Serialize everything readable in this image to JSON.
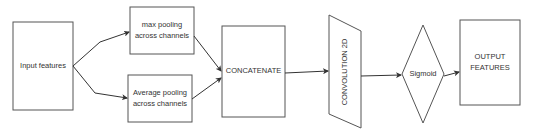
{
  "diagram": {
    "nodes": {
      "input": {
        "label": "Input features",
        "shape": "rectangle"
      },
      "max_pool": {
        "label": "max pooling across channels",
        "shape": "rectangle"
      },
      "avg_pool": {
        "label": "Average pooling across channels",
        "shape": "rectangle"
      },
      "concat": {
        "label": "CONCATENATE",
        "shape": "rectangle"
      },
      "conv": {
        "label": "CONVOLUTION 2D",
        "shape": "parallelogram"
      },
      "sigmoid": {
        "label": "Sigmoid",
        "shape": "diamond"
      },
      "output": {
        "label": "OUTPUT FEATURES",
        "shape": "rectangle"
      }
    },
    "edges": [
      {
        "from": "Input features",
        "to": "max pooling across channels"
      },
      {
        "from": "Input features",
        "to": "Average pooling across channels"
      },
      {
        "from": "max pooling across channels",
        "to": "CONCATENATE"
      },
      {
        "from": "Average pooling across channels",
        "to": "CONCATENATE"
      },
      {
        "from": "CONCATENATE",
        "to": "CONVOLUTION 2D"
      },
      {
        "from": "CONVOLUTION 2D",
        "to": "Sigmoid"
      },
      {
        "from": "Sigmoid",
        "to": "OUTPUT FEATURES"
      }
    ],
    "colors": {
      "stroke": "#555555",
      "edge": "#333333",
      "text": "#333333",
      "background": "#ffffff"
    }
  }
}
